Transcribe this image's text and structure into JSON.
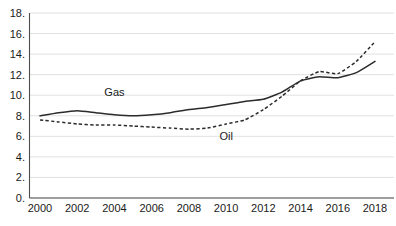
{
  "chart_data": {
    "type": "line",
    "title": "",
    "subtitle": "",
    "xlabel": "",
    "ylabel": "",
    "xlim": [
      2000,
      2018
    ],
    "ylim": [
      0.0,
      18.0
    ],
    "grid": true,
    "grid_axis": "y",
    "legend": "inline-labels",
    "x": [
      2000,
      2001,
      2002,
      2003,
      2004,
      2005,
      2006,
      2007,
      2008,
      2009,
      2010,
      2011,
      2012,
      2013,
      2014,
      2015,
      2016,
      2017,
      2018
    ],
    "series": [
      {
        "name": "Gas",
        "style": "solid",
        "color": "#2b2b2b",
        "label_position": {
          "x": 2004,
          "y": 9.9
        },
        "values": [
          8.0,
          8.3,
          8.5,
          8.3,
          8.1,
          8.0,
          8.1,
          8.3,
          8.6,
          8.8,
          9.1,
          9.4,
          9.6,
          10.3,
          11.4,
          11.8,
          11.7,
          12.2,
          13.3
        ]
      },
      {
        "name": "Oil",
        "style": "dashed",
        "color": "#2b2b2b",
        "label_position": {
          "x": 2010,
          "y": 5.6
        },
        "values": [
          7.6,
          7.4,
          7.2,
          7.1,
          7.1,
          7.0,
          6.9,
          6.8,
          6.7,
          6.8,
          7.2,
          7.6,
          8.6,
          9.9,
          11.4,
          12.3,
          12.1,
          13.3,
          15.2
        ]
      }
    ],
    "y_ticks": [
      {
        "value": 0.0,
        "label": "0."
      },
      {
        "value": 2.0,
        "label": "2."
      },
      {
        "value": 4.0,
        "label": "4."
      },
      {
        "value": 6.0,
        "label": "6."
      },
      {
        "value": 8.0,
        "label": "8."
      },
      {
        "value": 10.0,
        "label": "10."
      },
      {
        "value": 12.0,
        "label": "12."
      },
      {
        "value": 14.0,
        "label": "14."
      },
      {
        "value": 16.0,
        "label": "16."
      },
      {
        "value": 18.0,
        "label": "18."
      }
    ],
    "x_ticks": [
      {
        "value": 2000,
        "label": "2000"
      },
      {
        "value": 2002,
        "label": "2002"
      },
      {
        "value": 2004,
        "label": "2004"
      },
      {
        "value": 2006,
        "label": "2006"
      },
      {
        "value": 2008,
        "label": "2008"
      },
      {
        "value": 2010,
        "label": "2010"
      },
      {
        "value": 2012,
        "label": "2012"
      },
      {
        "value": 2014,
        "label": "2014"
      },
      {
        "value": 2016,
        "label": "2016"
      },
      {
        "value": 2018,
        "label": "2018"
      }
    ],
    "colors": {
      "background": "#ffffff",
      "gridline": "#d9d9d9",
      "axis": "#4d4d4d",
      "text": "#1a1a1a",
      "series": "#2b2b2b"
    }
  }
}
